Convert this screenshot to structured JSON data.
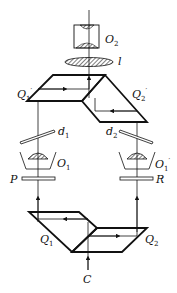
{
  "figure": {
    "labels": {
      "O2": {
        "base": "O",
        "sub": "2"
      },
      "l": {
        "base": "l"
      },
      "Q1p": {
        "base": "Q",
        "sub": "1",
        "sup": "′"
      },
      "Q2p": {
        "base": "Q",
        "sub": "2",
        "sup": "′"
      },
      "d1": {
        "base": "d",
        "sub": "1"
      },
      "d2": {
        "base": "d",
        "sub": "2"
      },
      "O1": {
        "base": "O",
        "sub": "1"
      },
      "O1p": {
        "base": "O",
        "sub": "1",
        "sup": "′"
      },
      "P": {
        "base": "P"
      },
      "R": {
        "base": "R"
      },
      "Q1": {
        "base": "Q",
        "sub": "1"
      },
      "Q2": {
        "base": "Q",
        "sub": "2"
      },
      "C": {
        "base": "C"
      }
    },
    "colors": {
      "line": "#111111",
      "background": "#ffffff"
    }
  }
}
